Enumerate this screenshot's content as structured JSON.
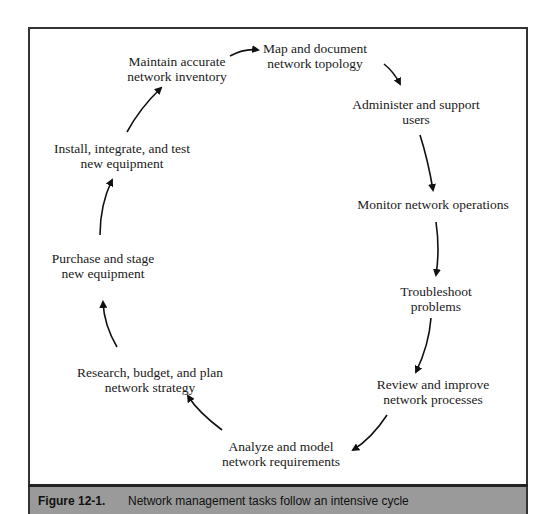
{
  "diagram": {
    "type": "cycle",
    "nodes": [
      {
        "id": "map",
        "lines": [
          "Map and document",
          "network topology"
        ]
      },
      {
        "id": "administer",
        "lines": [
          "Administer and support",
          "users"
        ]
      },
      {
        "id": "monitor",
        "lines": [
          "Monitor network operations"
        ]
      },
      {
        "id": "troubleshoot",
        "lines": [
          "Troubleshoot",
          "problems"
        ]
      },
      {
        "id": "review",
        "lines": [
          "Review and improve",
          "network processes"
        ]
      },
      {
        "id": "analyze",
        "lines": [
          "Analyze and model",
          "network requirements"
        ]
      },
      {
        "id": "research",
        "lines": [
          "Research, budget, and plan",
          "network strategy"
        ]
      },
      {
        "id": "purchase",
        "lines": [
          "Purchase and stage",
          "new equipment"
        ]
      },
      {
        "id": "install",
        "lines": [
          "Install, integrate, and test",
          "new equipment"
        ]
      },
      {
        "id": "maintain",
        "lines": [
          "Maintain accurate",
          "network inventory"
        ]
      }
    ],
    "edges": [
      [
        "maintain",
        "map"
      ],
      [
        "map",
        "administer"
      ],
      [
        "administer",
        "monitor"
      ],
      [
        "monitor",
        "troubleshoot"
      ],
      [
        "troubleshoot",
        "review"
      ],
      [
        "review",
        "analyze"
      ],
      [
        "analyze",
        "research"
      ],
      [
        "research",
        "purchase"
      ],
      [
        "purchase",
        "install"
      ],
      [
        "install",
        "maintain"
      ]
    ]
  },
  "caption": {
    "label": "Figure 12-1.",
    "text": "Network management tasks follow an intensive cycle"
  },
  "colors": {
    "frame": "#333333",
    "caption_bg": "#9a9a9a",
    "text": "#1a1a1a"
  }
}
